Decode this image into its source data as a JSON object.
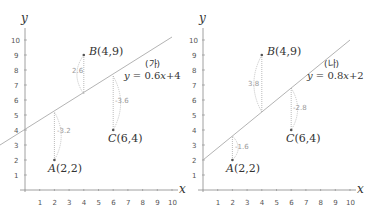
{
  "colors": {
    "axis": "#888888",
    "line": "#aaaaaa",
    "point": "#555555",
    "residual": "#aaaaaa",
    "text": "#333333"
  },
  "panels": [
    {
      "label": "(가)",
      "equation": "y = 0.6x + 4",
      "slope": 0.6,
      "intercept": 4,
      "residuals": [
        {
          "point": "A",
          "value": "-3.2"
        },
        {
          "point": "B",
          "value": "2.6"
        },
        {
          "point": "C",
          "value": "-3.6"
        }
      ]
    },
    {
      "label": "(나)",
      "equation": "y = 0.8x + 2",
      "slope": 0.8,
      "intercept": 2,
      "residuals": [
        {
          "point": "A",
          "value": "-1.6"
        },
        {
          "point": "B",
          "value": "3.8"
        },
        {
          "point": "C",
          "value": "-2.8"
        }
      ]
    }
  ],
  "points": [
    {
      "name": "A",
      "label": "A(2,2)",
      "x": 2,
      "y": 2
    },
    {
      "name": "B",
      "label": "B(4,9)",
      "x": 4,
      "y": 9
    },
    {
      "name": "C",
      "label": "C(6,4)",
      "x": 6,
      "y": 4
    }
  ],
  "axes": {
    "x_label": "x",
    "y_label": "y",
    "x_ticks": [
      "1",
      "2",
      "3",
      "4",
      "5",
      "6",
      "7",
      "8",
      "9",
      "10"
    ],
    "y_ticks": [
      "1",
      "2",
      "3",
      "4",
      "5",
      "6",
      "7",
      "8",
      "9",
      "10"
    ]
  },
  "text": {
    "left_label": "(가)",
    "left_eq": "y = 0.6x+4",
    "right_label": "(나)",
    "right_eq": "y = 0.8x+2",
    "A": "A(2,2)",
    "B": "B(4,9)",
    "C": "C(6,4)",
    "x": "x",
    "y": "y",
    "l_rA": "-3.2",
    "l_rB": "2.6",
    "l_rC": "-3.6",
    "r_rA": "-1.6",
    "r_rB": "3.8",
    "r_rC": "-2.8",
    "t1": "1",
    "t2": "2",
    "t3": "3",
    "t4": "4",
    "t5": "5",
    "t6": "6",
    "t7": "7",
    "t8": "8",
    "t9": "9",
    "t10": "10"
  }
}
